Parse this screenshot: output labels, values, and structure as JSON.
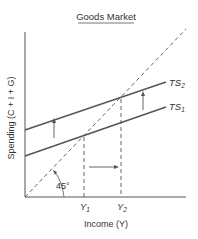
{
  "title": "Goods Market",
  "axes": {
    "x_label": "Income (Y)",
    "y_label": "Spending (C + I + G)"
  },
  "curves": {
    "ts1": {
      "label": "TS",
      "sub": "1"
    },
    "ts2": {
      "label": "TS",
      "sub": "2"
    },
    "guide": {
      "label": "45°"
    }
  },
  "ticks": {
    "y1": {
      "label": "Y",
      "sub": "1"
    },
    "y2": {
      "label": "Y",
      "sub": "2"
    }
  },
  "colors": {
    "line": "#555555",
    "text": "#333333"
  }
}
